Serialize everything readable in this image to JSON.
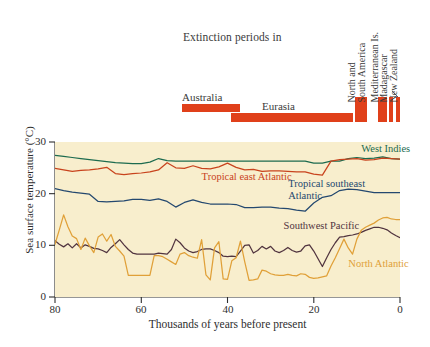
{
  "extinction": {
    "title": "Extinction periods in",
    "bar_color": "#e0401a",
    "regions": [
      {
        "name": "Australia",
        "label": "Australia",
        "orientation": "horizontal",
        "start_ka": 64,
        "end_ka": 46
      },
      {
        "name": "Eurasia",
        "label": "Eurasia",
        "orientation": "horizontal",
        "start_ka": 48,
        "end_ka": 12
      },
      {
        "name": "North and South America",
        "label": "North and\nSouth America",
        "orientation": "vertical",
        "start_ka": 12,
        "end_ka": 9
      },
      {
        "name": "Mediterranean Islands",
        "label": "Mediterranean Is.",
        "orientation": "vertical",
        "start_ka": 6,
        "end_ka": 4
      },
      {
        "name": "Madagascar",
        "label": "Madagascar",
        "orientation": "vertical",
        "start_ka": 3,
        "end_ka": 2.3
      },
      {
        "name": "New Zealand",
        "label": "New Zealand",
        "orientation": "vertical",
        "start_ka": 1.6,
        "end_ka": 1.0
      }
    ]
  },
  "chart_data": {
    "type": "line",
    "title": "",
    "xlabel": "Thousands of years before present",
    "ylabel": "Sea surface temperature (°C)",
    "xlim": [
      80,
      0
    ],
    "ylim": [
      0,
      30
    ],
    "x_ticks": [
      80,
      60,
      40,
      20,
      0
    ],
    "y_ticks": [
      0,
      10,
      20,
      30
    ],
    "grid": false,
    "x_reversed": true,
    "plot_background": "#f8eecd",
    "legend": "inline-annotations",
    "series": [
      {
        "name": "West Indies",
        "color": "#1d6b4f",
        "label_x_ka": 9,
        "label_y_c": 28.4,
        "x": [
          80,
          78,
          76,
          74,
          72,
          70,
          68,
          66,
          64,
          62,
          60,
          58,
          56,
          54,
          52,
          50,
          48,
          46,
          44,
          42,
          40,
          38,
          36,
          34,
          32,
          30,
          28,
          26,
          24,
          22,
          20,
          18,
          16,
          14,
          12,
          10,
          8,
          6,
          4,
          2,
          0
        ],
        "y": [
          27.4,
          27.2,
          27.0,
          26.8,
          26.6,
          26.4,
          26.2,
          26.0,
          25.9,
          25.8,
          25.8,
          26.1,
          26.8,
          26.4,
          26.3,
          26.3,
          26.3,
          26.3,
          26.3,
          26.3,
          26.3,
          26.3,
          26.3,
          26.3,
          26.3,
          26.3,
          26.3,
          26.3,
          26.3,
          26.3,
          25.9,
          25.9,
          26.3,
          26.3,
          26.8,
          27.0,
          26.8,
          26.9,
          27.1,
          26.8,
          26.7
        ]
      },
      {
        "name": "Tropical east Atlantic",
        "color": "#c8431d",
        "label_x_ka": 46,
        "label_y_c": 23.0,
        "x": [
          80,
          78,
          76,
          74,
          72,
          70,
          68,
          66,
          64,
          62,
          60,
          58,
          56,
          54,
          52,
          50,
          48,
          46,
          44,
          42,
          40,
          38,
          36,
          34,
          32,
          30,
          28,
          26,
          24,
          22,
          20,
          18,
          16,
          14,
          12,
          10,
          8,
          6,
          4,
          2,
          0
        ],
        "y": [
          24.9,
          24.6,
          24.3,
          24.5,
          24.6,
          24.8,
          25.1,
          23.9,
          23.7,
          23.9,
          24.0,
          24.2,
          24.6,
          26.0,
          25.0,
          24.9,
          25.4,
          24.9,
          24.8,
          25.2,
          25.9,
          25.1,
          24.6,
          24.7,
          24.3,
          24.4,
          24.4,
          24.3,
          24.2,
          24.2,
          23.8,
          23.6,
          26.3,
          26.6,
          26.7,
          26.8,
          26.5,
          26.6,
          26.9,
          26.8,
          26.7
        ]
      },
      {
        "name": "Tropical southeast Atlantic",
        "color": "#24486f",
        "label_x_ka": 25,
        "label_y_c": 21.6,
        "x": [
          80,
          78,
          76,
          74,
          72,
          70,
          68,
          66,
          64,
          62,
          60,
          58,
          56,
          54,
          52,
          50,
          48,
          46,
          44,
          42,
          40,
          38,
          36,
          34,
          32,
          30,
          28,
          26,
          24,
          22,
          20,
          18,
          16,
          14,
          12,
          10,
          8,
          6,
          4,
          2,
          0
        ],
        "y": [
          21.0,
          20.6,
          20.3,
          20.1,
          19.9,
          18.5,
          18.4,
          18.5,
          18.6,
          18.9,
          18.9,
          18.7,
          19.0,
          18.5,
          17.4,
          18.3,
          18.8,
          18.3,
          18.0,
          18.0,
          18.0,
          17.9,
          17.3,
          17.3,
          17.4,
          17.4,
          17.2,
          17.1,
          16.8,
          16.6,
          18.2,
          19.3,
          19.6,
          20.6,
          20.9,
          20.8,
          20.5,
          20.2,
          20.2,
          20.2,
          20.2
        ]
      },
      {
        "name": "Southwest Pacific",
        "color": "#51343f",
        "label_x_ka": 27,
        "label_y_c": 13.6,
        "x": [
          80,
          79,
          78,
          77,
          76,
          75,
          74,
          73,
          72,
          71,
          70,
          69,
          68,
          67,
          66,
          65,
          64,
          63,
          62,
          61,
          60,
          59,
          58,
          57,
          56,
          55,
          54,
          53,
          52,
          51,
          50,
          49,
          48,
          47,
          46,
          45,
          44,
          43,
          42,
          41,
          40,
          39,
          38,
          37,
          36,
          35,
          34,
          33,
          32,
          31,
          30,
          29,
          28,
          27,
          26,
          25,
          24,
          23,
          22,
          21,
          20,
          19,
          18,
          17,
          16,
          15,
          14,
          13,
          12,
          11,
          10,
          9,
          8,
          7,
          6,
          5,
          4,
          3,
          2,
          1,
          0
        ],
        "y": [
          10.9,
          10.2,
          9.7,
          10.3,
          9.5,
          10.3,
          9.5,
          10.1,
          9.8,
          9.4,
          9.3,
          9.0,
          8.6,
          9.6,
          10.3,
          11.1,
          10.1,
          9.2,
          8.5,
          8.3,
          8.3,
          8.3,
          8.3,
          8.3,
          8.5,
          8.4,
          8.3,
          9.2,
          11.2,
          10.5,
          9.5,
          8.9,
          8.6,
          8.8,
          9.2,
          9.3,
          9.3,
          9.0,
          8.6,
          7.9,
          7.8,
          7.9,
          7.8,
          8.9,
          10.0,
          10.1,
          8.5,
          9.0,
          9.8,
          9.3,
          9.8,
          8.9,
          8.6,
          9.0,
          9.6,
          9.0,
          8.7,
          8.9,
          9.9,
          10.1,
          8.9,
          7.4,
          5.9,
          7.6,
          9.2,
          10.5,
          11.6,
          11.7,
          11.9,
          12.0,
          12.2,
          12.5,
          12.9,
          13.2,
          13.5,
          13.5,
          13.3,
          13.0,
          12.4,
          11.9,
          11.5
        ]
      },
      {
        "name": "North Atlantic",
        "color": "#e0a038",
        "label_x_ka": 12,
        "label_y_c": 6.2,
        "x": [
          80,
          79,
          78,
          77,
          76,
          75,
          74,
          73,
          72,
          71,
          70,
          69,
          68,
          67,
          66,
          65,
          64,
          63,
          62,
          61,
          60,
          59,
          58,
          57,
          56,
          55,
          54,
          53,
          52,
          51,
          50,
          49,
          48,
          47,
          46,
          45,
          44,
          43,
          42,
          41,
          40,
          39,
          38,
          37,
          36,
          35,
          34,
          33,
          32,
          31,
          30,
          29,
          28,
          27,
          26,
          25,
          24,
          23,
          22,
          21,
          20,
          19,
          18,
          17,
          16,
          15,
          14,
          13,
          12,
          11,
          10,
          9,
          8,
          7,
          6,
          5,
          4,
          3,
          2,
          1,
          0
        ],
        "y": [
          10.2,
          13.0,
          15.9,
          13.6,
          11.8,
          11.3,
          9.2,
          11.4,
          9.9,
          8.6,
          11.6,
          12.2,
          10.8,
          12.1,
          9.8,
          8.9,
          7.9,
          4.2,
          4.2,
          4.2,
          4.2,
          4.2,
          4.2,
          8.0,
          8.0,
          7.8,
          7.3,
          6.8,
          6.3,
          8.3,
          8.6,
          8.0,
          7.7,
          7.5,
          11.1,
          4.3,
          3.3,
          9.5,
          10.7,
          3.5,
          3.4,
          7.0,
          7.6,
          10.8,
          6.8,
          3.2,
          3.3,
          3.5,
          5.2,
          5.0,
          4.5,
          4.3,
          4.2,
          4.2,
          4.4,
          4.2,
          4.1,
          4.5,
          4.4,
          3.8,
          3.6,
          3.7,
          3.9,
          4.1,
          6.0,
          7.6,
          9.4,
          11.2,
          9.5,
          8.3,
          11.2,
          12.9,
          13.5,
          13.9,
          14.3,
          14.9,
          15.3,
          15.4,
          15.1,
          15.0,
          15.0
        ]
      }
    ]
  }
}
